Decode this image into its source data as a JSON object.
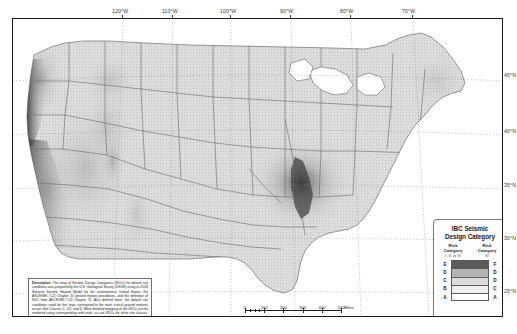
{
  "map": {
    "title": "Seismic Design Categories (SDCs) of the Conterminous United States",
    "background_color": "#ffffff",
    "frame_color": "#1a1a1a",
    "land_fill": "#d8d8d8",
    "water_fill": "#ffffff"
  },
  "graticule": {
    "longitude_labels": [
      "120°W",
      "110°W",
      "100°W",
      "90°W",
      "80°W",
      "70°W"
    ],
    "longitude_x": [
      122,
      172,
      230,
      290,
      350,
      412
    ],
    "latitude_labels": [
      "45°N",
      "40°N",
      "35°N",
      "30°N",
      "25°N"
    ],
    "latitude_y": [
      75,
      131,
      185,
      238,
      291
    ]
  },
  "legend": {
    "title_line1": "IBC Seismic",
    "title_line2": "Design Category",
    "left_col": {
      "header_line1": "Risk",
      "header_line2": "Category",
      "header_line3": "I, II, or III"
    },
    "right_col": {
      "header_line1": "Risk",
      "header_line2": "Category",
      "header_line3": "IV"
    },
    "rows": [
      {
        "left": "E",
        "right": "F",
        "color": "#5a5a5a"
      },
      {
        "left": "D",
        "right": "D",
        "color": "#b4b4b4"
      },
      {
        "left": "C",
        "right": "D",
        "color": "#dcdcdc"
      },
      {
        "left": "B",
        "right": "C",
        "color": "#f0f0f0"
      },
      {
        "left": "A",
        "right": "A",
        "color": "#ffffff"
      }
    ]
  },
  "description": {
    "label": "Description:",
    "text": " This map of Seismic Design Categories (SDCs) for default site conditions was prepared by the U.S. Geological Survey (USGS) using its 2018 National Seismic Hazard Model for the conterminous United States, the ASCE/SEI 7-22 Chapter 21 ground motion procedures, and the definition of SDC from ASCE/SEI 7-22 Chapter 11. Also defined there, the default site conditions used for this map correspond to the most critical ground motions across Site Classes C, CD, and D. More detailed mapping of the SDCs can be rendered using corresponding web tools, as can SDCs for other site classes. For mapping, see https://doi.org/10.5066/P9RK4C7B."
  },
  "scale_bars": [
    {
      "unit": "Miles",
      "ticks": [
        "0",
        "100",
        "200",
        "300",
        "400",
        "500"
      ],
      "major_positions": [
        0,
        19.2,
        38.4,
        57.6,
        76.8,
        96
      ]
    },
    {
      "unit": "kilometers",
      "ticks": [
        "0",
        "100",
        "200",
        "300",
        "400",
        "500"
      ],
      "major_positions": [
        0,
        11.9,
        23.8,
        35.7,
        47.7,
        59.6
      ]
    }
  ],
  "hazard_zones": [
    {
      "name": "cascadia-coast",
      "category": "E",
      "intensity": "very-high"
    },
    {
      "name": "california-san-andreas",
      "category": "E",
      "intensity": "very-high"
    },
    {
      "name": "intermountain-west",
      "category": "D",
      "intensity": "moderate"
    },
    {
      "name": "wasatch-front",
      "category": "D",
      "intensity": "high"
    },
    {
      "name": "new-madrid",
      "category": "E",
      "intensity": "very-high"
    },
    {
      "name": "charleston-sc",
      "category": "D",
      "intensity": "high"
    },
    {
      "name": "eastern-seaboard",
      "category": "B",
      "intensity": "low"
    },
    {
      "name": "great-plains",
      "category": "A",
      "intensity": "very-low"
    }
  ]
}
